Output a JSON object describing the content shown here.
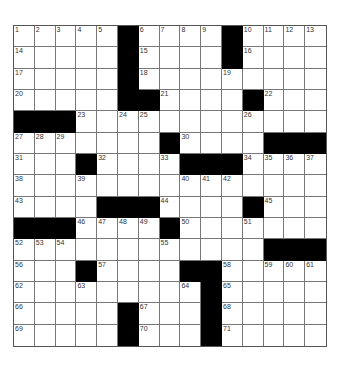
{
  "puzzle": {
    "rows": 15,
    "cols": 15,
    "black_color": "#000000",
    "blacks": [
      [
        0,
        5
      ],
      [
        0,
        10
      ],
      [
        1,
        5
      ],
      [
        1,
        10
      ],
      [
        2,
        5
      ],
      [
        3,
        5
      ],
      [
        3,
        6
      ],
      [
        3,
        11
      ],
      [
        4,
        0
      ],
      [
        4,
        1
      ],
      [
        4,
        2
      ],
      [
        5,
        7
      ],
      [
        5,
        12
      ],
      [
        5,
        13
      ],
      [
        5,
        14
      ],
      [
        6,
        3
      ],
      [
        6,
        8
      ],
      [
        6,
        9
      ],
      [
        6,
        10
      ],
      [
        8,
        4
      ],
      [
        8,
        5
      ],
      [
        8,
        6
      ],
      [
        8,
        11
      ],
      [
        9,
        0
      ],
      [
        9,
        1
      ],
      [
        9,
        2
      ],
      [
        9,
        7
      ],
      [
        10,
        12
      ],
      [
        10,
        13
      ],
      [
        10,
        14
      ],
      [
        11,
        3
      ],
      [
        11,
        8
      ],
      [
        11,
        9
      ],
      [
        12,
        9
      ],
      [
        13,
        5
      ],
      [
        13,
        9
      ],
      [
        14,
        5
      ],
      [
        14,
        9
      ]
    ],
    "numbers": [
      [
        0,
        0,
        "1"
      ],
      [
        0,
        1,
        "2"
      ],
      [
        0,
        2,
        "3"
      ],
      [
        0,
        3,
        "4"
      ],
      [
        0,
        4,
        "5"
      ],
      [
        0,
        6,
        "6"
      ],
      [
        0,
        7,
        "7"
      ],
      [
        0,
        8,
        "8"
      ],
      [
        0,
        9,
        "9"
      ],
      [
        0,
        11,
        "10"
      ],
      [
        0,
        12,
        "11"
      ],
      [
        0,
        13,
        "12"
      ],
      [
        0,
        14,
        "13"
      ],
      [
        1,
        0,
        "14"
      ],
      [
        1,
        6,
        "15"
      ],
      [
        1,
        11,
        "16"
      ],
      [
        2,
        0,
        "17"
      ],
      [
        2,
        6,
        "18"
      ],
      [
        2,
        10,
        "19"
      ],
      [
        3,
        0,
        "20"
      ],
      [
        3,
        7,
        "21"
      ],
      [
        3,
        12,
        "22"
      ],
      [
        4,
        3,
        "23"
      ],
      [
        4,
        5,
        "24"
      ],
      [
        4,
        6,
        "25"
      ],
      [
        4,
        11,
        "26"
      ],
      [
        5,
        0,
        "27"
      ],
      [
        5,
        1,
        "28"
      ],
      [
        5,
        2,
        "29"
      ],
      [
        5,
        8,
        "30"
      ],
      [
        6,
        0,
        "31"
      ],
      [
        6,
        4,
        "32"
      ],
      [
        6,
        7,
        "33"
      ],
      [
        6,
        11,
        "34"
      ],
      [
        6,
        12,
        "35"
      ],
      [
        6,
        13,
        "36"
      ],
      [
        6,
        14,
        "37"
      ],
      [
        7,
        0,
        "38"
      ],
      [
        7,
        3,
        "39"
      ],
      [
        7,
        8,
        "40"
      ],
      [
        7,
        9,
        "41"
      ],
      [
        7,
        10,
        "42"
      ],
      [
        8,
        0,
        "43"
      ],
      [
        8,
        7,
        "44"
      ],
      [
        8,
        12,
        "45"
      ],
      [
        9,
        3,
        "46"
      ],
      [
        9,
        4,
        "47"
      ],
      [
        9,
        5,
        "48"
      ],
      [
        9,
        6,
        "49"
      ],
      [
        9,
        8,
        "50"
      ],
      [
        9,
        11,
        "51"
      ],
      [
        10,
        0,
        "52"
      ],
      [
        10,
        1,
        "53"
      ],
      [
        10,
        2,
        "54"
      ],
      [
        10,
        7,
        "55"
      ],
      [
        11,
        0,
        "56"
      ],
      [
        11,
        4,
        "57"
      ],
      [
        11,
        10,
        "58"
      ],
      [
        11,
        12,
        "59"
      ],
      [
        11,
        13,
        "60"
      ],
      [
        11,
        14,
        "61"
      ],
      [
        12,
        0,
        "62"
      ],
      [
        12,
        3,
        "63"
      ],
      [
        12,
        8,
        "64"
      ],
      [
        12,
        10,
        "65"
      ],
      [
        13,
        0,
        "66"
      ],
      [
        13,
        6,
        "67"
      ],
      [
        13,
        10,
        "68"
      ],
      [
        14,
        0,
        "69"
      ],
      [
        14,
        6,
        "70"
      ],
      [
        14,
        10,
        "71"
      ]
    ]
  },
  "footer": {
    "text": ""
  }
}
